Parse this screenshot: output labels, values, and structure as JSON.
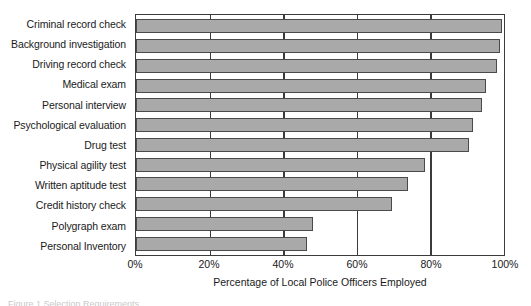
{
  "chart_data": {
    "type": "bar",
    "orientation": "horizontal",
    "title": "",
    "xlabel": "Percentage of Local Police Officers Employed",
    "ylabel": "",
    "xlim": [
      0,
      100
    ],
    "xticks": [
      0,
      20,
      40,
      60,
      80,
      100
    ],
    "xtick_labels": [
      "0%",
      "20%",
      "40%",
      "60%",
      "80%",
      "100%"
    ],
    "grid": "vertical",
    "legend": "none",
    "bar_color": "#a9a9a9",
    "bar_edge_color": "#4a4a4a",
    "axis_color": "#3b3b3b",
    "categories": [
      "Criminal record check",
      "Background investigation",
      "Driving record check",
      "Medical exam",
      "Personal interview",
      "Psychological evaluation",
      "Drug test",
      "Physical agility test",
      "Written aptitude test",
      "Credit history check",
      "Polygraph exam",
      "Personal Inventory"
    ],
    "values": [
      99.5,
      99,
      98,
      95,
      94,
      91.5,
      90.5,
      78.5,
      74,
      69.5,
      48,
      46.5
    ],
    "units": "%"
  },
  "caption": {
    "text": "Figure 1 Selection Requirements"
  }
}
